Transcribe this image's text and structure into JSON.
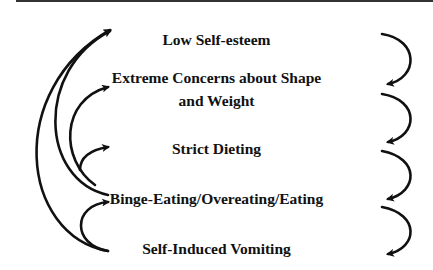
{
  "diagram": {
    "type": "cycle-flow",
    "nodes": [
      {
        "id": "n1",
        "label": "Low Self-esteem"
      },
      {
        "id": "n2",
        "label_line1": "Extreme Concerns about Shape",
        "label_line2": "and Weight"
      },
      {
        "id": "n3",
        "label": "Strict Dieting"
      },
      {
        "id": "n4",
        "label": "Binge-Eating/Overeating/Eating"
      },
      {
        "id": "n5",
        "label": "Self-Induced Vomiting"
      }
    ],
    "edges_right": [
      {
        "from": "n1",
        "to": "n2"
      },
      {
        "from": "n2",
        "to": "n3"
      },
      {
        "from": "n3",
        "to": "n4"
      },
      {
        "from": "n4",
        "to": "n5"
      }
    ],
    "edges_left": [
      {
        "from": "n4",
        "to": "n1"
      },
      {
        "from": "n4",
        "to": "n2"
      },
      {
        "from": "n4",
        "to": "n3"
      },
      {
        "from": "n5",
        "to": "n1"
      },
      {
        "from": "n5",
        "to": "n4"
      }
    ],
    "colors": {
      "stroke": "#111111",
      "text": "#111111",
      "background": "#ffffff"
    }
  }
}
